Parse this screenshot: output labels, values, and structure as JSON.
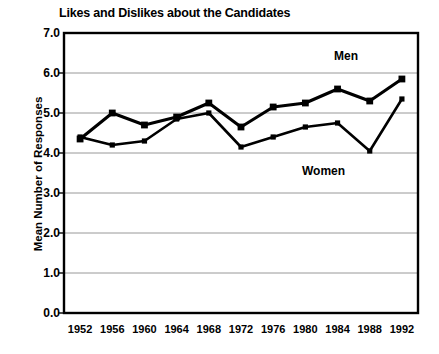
{
  "chart_data": {
    "type": "line",
    "title": "Likes and Dislikes about the Candidates",
    "xlabel": "",
    "ylabel": "Mean Number of Responses",
    "categories": [
      "1952",
      "1956",
      "1960",
      "1964",
      "1968",
      "1972",
      "1976",
      "1980",
      "1984",
      "1988",
      "1992"
    ],
    "ylim": [
      0.0,
      7.0
    ],
    "ytick_labels": [
      "0.0",
      "1.0",
      "2.0",
      "3.0",
      "4.0",
      "5.0",
      "6.0",
      "7.0"
    ],
    "ytick_values": [
      0.0,
      1.0,
      2.0,
      3.0,
      4.0,
      5.0,
      6.0,
      7.0
    ],
    "grid": true,
    "legend_position": "inline-annotation",
    "series": [
      {
        "name": "Men",
        "marker": "square",
        "color": "#000000",
        "values": [
          4.35,
          5.0,
          4.7,
          4.9,
          5.25,
          4.65,
          5.15,
          5.25,
          5.6,
          5.3,
          5.85
        ]
      },
      {
        "name": "Women",
        "marker": "square-small",
        "color": "#000000",
        "values": [
          4.4,
          4.2,
          4.3,
          4.85,
          5.0,
          4.15,
          4.4,
          4.65,
          4.75,
          4.05,
          5.35
        ]
      }
    ],
    "annotations": [
      {
        "text": "Men",
        "series": "Men"
      },
      {
        "text": "Women",
        "series": "Women"
      }
    ]
  }
}
